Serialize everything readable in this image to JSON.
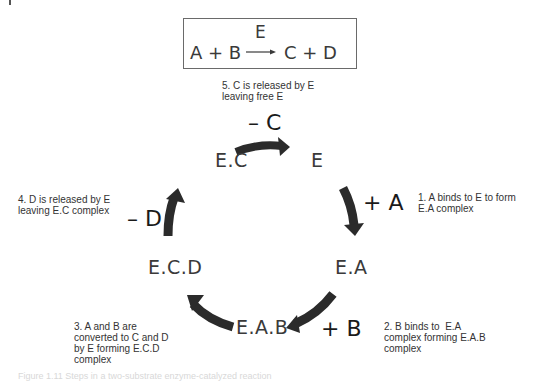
{
  "equation": {
    "left": "A + B",
    "enzyme": "E",
    "right": "C + D"
  },
  "cycle": {
    "nodes": {
      "e": "E",
      "ea": "E.A",
      "eab": "E.A.B",
      "ecd": "E.C.D",
      "ec": "E.C"
    },
    "symbols": {
      "plus_a": "+ A",
      "plus_b": "+ B",
      "minus_d": "– D",
      "minus_c": "– C"
    },
    "steps": [
      {
        "number": 1,
        "text": "1. A binds to E to form\nE.A complex"
      },
      {
        "number": 2,
        "text": "2. B binds to  E.A\ncomplex forming E.A.B\ncomplex"
      },
      {
        "number": 3,
        "text": "3. A and B are\nconverted to C and D\nby E forming E.C.D\ncomplex"
      },
      {
        "number": 4,
        "text": "4. D is released by E\nleaving E.C complex"
      },
      {
        "number": 5,
        "text": "5. C is released by E\nleaving free E"
      }
    ]
  },
  "colors": {
    "arrow": "#2b2b2b",
    "text": "#3a3a3a",
    "box_border": "#6a6a6a"
  },
  "caption": "Figure 1.11  Steps in a two-substrate enzyme-catalyzed reaction"
}
